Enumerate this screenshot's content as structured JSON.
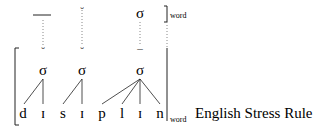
{
  "diagram": {
    "top_tier": {
      "marks": [
        {
          "type": "macron-bar",
          "x": 42
        },
        {
          "type": "breve",
          "symbol": "˘",
          "x": 82
        },
        {
          "type": "syllable",
          "symbol": "σ",
          "x": 140
        }
      ],
      "bracket_subscript": "word"
    },
    "mid_tier": {
      "marks": [
        {
          "type": "breve",
          "symbol": "˘",
          "x": 43
        },
        {
          "type": "breve",
          "symbol": "˘",
          "x": 82
        },
        {
          "type": "macron",
          "symbol": "¯",
          "x": 140
        }
      ]
    },
    "syllables": [
      {
        "symbol": "σ",
        "x": 43
      },
      {
        "symbol": "σ",
        "x": 82
      },
      {
        "symbol": "σ",
        "x": 140
      }
    ],
    "segments": [
      {
        "symbol": "d",
        "x": 23
      },
      {
        "symbol": "ɪ",
        "x": 43
      },
      {
        "symbol": "s",
        "x": 63
      },
      {
        "symbol": "ɪ",
        "x": 82
      },
      {
        "symbol": "p",
        "x": 102
      },
      {
        "symbol": "l",
        "x": 122
      },
      {
        "symbol": "ɪ",
        "x": 140
      },
      {
        "symbol": "n",
        "x": 160
      }
    ],
    "word_subscript": "word",
    "rule_label": "English Stress Rule"
  },
  "colors": {
    "ink": "#222222",
    "dotted": "#888888",
    "background": "#ffffff"
  }
}
